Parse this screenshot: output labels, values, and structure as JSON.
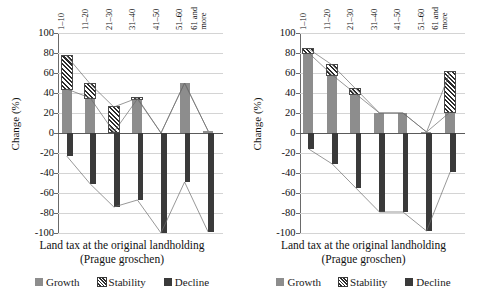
{
  "chart_data": [
    {
      "type": "bar",
      "panel": "left",
      "title": "",
      "xlabel": "Land tax at the original landholding",
      "xlabel_line2": "(Prague groschen)",
      "ylabel": "Change (%)",
      "ylim": [
        -100,
        100
      ],
      "yticks": [
        100,
        80,
        60,
        40,
        20,
        0,
        -20,
        -40,
        -60,
        -80,
        -100
      ],
      "ytick_labels": [
        "100",
        "80",
        "60",
        "40",
        "20",
        "0",
        "-20",
        "-40",
        "-60",
        "-80",
        "-100"
      ],
      "grid": true,
      "legend": [
        "Growth",
        "Stability",
        "Decline"
      ],
      "legend_position": "bottom",
      "categories": [
        "1–10",
        "11–20",
        "21–30",
        "31–40",
        "41–50",
        "51–60",
        "61 and more"
      ],
      "series": [
        {
          "name": "Growth",
          "values": [
            44,
            35,
            1,
            34,
            0,
            50,
            2
          ]
        },
        {
          "name": "Stability",
          "values": [
            33,
            14,
            25,
            1,
            0,
            0,
            0
          ]
        },
        {
          "name": "Decline",
          "values": [
            -23,
            -51,
            -74,
            -67,
            -100,
            -49,
            -99
          ]
        }
      ],
      "stability_tops": [
        77,
        49,
        26,
        35,
        0,
        50,
        2
      ]
    },
    {
      "type": "bar",
      "panel": "right",
      "title": "",
      "xlabel": "Land tax at the original landholding",
      "xlabel_line2": "(Prague groschen)",
      "ylabel": "Change (%)",
      "ylim": [
        -100,
        100
      ],
      "yticks": [
        100,
        80,
        60,
        40,
        20,
        0,
        -20,
        -40,
        -60,
        -80,
        -100
      ],
      "ytick_labels": [
        "100",
        "80",
        "60",
        "40",
        "20",
        "0",
        "-20",
        "-40",
        "-60",
        "-80",
        "-100"
      ],
      "grid": true,
      "legend": [
        "Growth",
        "Stability",
        "Decline"
      ],
      "legend_position": "bottom",
      "categories": [
        "1–10",
        "11–20",
        "21–30",
        "31–40",
        "41–50",
        "51–60",
        "61 and more"
      ],
      "series": [
        {
          "name": "Growth",
          "values": [
            80,
            58,
            39,
            20,
            20,
            1,
            21
          ]
        },
        {
          "name": "Stability",
          "values": [
            4,
            10,
            5,
            0,
            0,
            0,
            40
          ]
        },
        {
          "name": "Decline",
          "values": [
            -16,
            -31,
            -55,
            -79,
            -79,
            -98,
            -39
          ]
        }
      ],
      "stability_tops": [
        84,
        68,
        44,
        20,
        20,
        1,
        61
      ]
    }
  ],
  "legend_labels": {
    "growth": "Growth",
    "stability": "Stability",
    "decline": "Decline"
  },
  "axis": {
    "ylabel": "Change (%)",
    "xlabel_line1": "Land tax at the original landholding",
    "xlabel_line2": "(Prague groschen)"
  },
  "colors": {
    "growth": "#8d8d8d",
    "stability_hatch": "#2b2b2b",
    "decline": "#3a3a3a",
    "grid": "#d4d4d4",
    "axis": "#5a5a5a"
  }
}
